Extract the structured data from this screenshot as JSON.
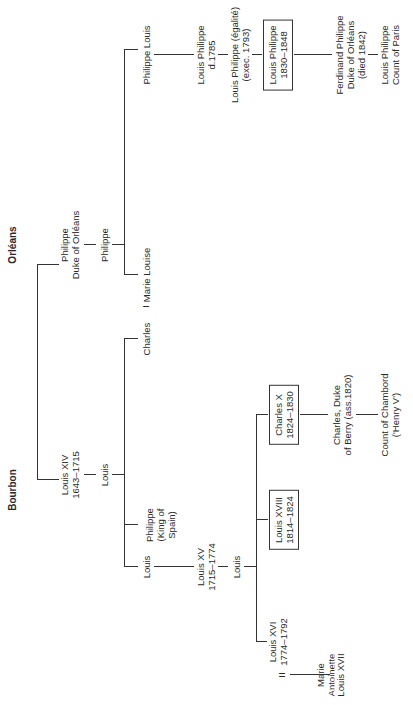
{
  "houses": {
    "bourbon": "Bourbon",
    "orleans": "Orléans"
  },
  "people": {
    "louis_xiv": [
      "Louis XIV",
      "1643–1715"
    ],
    "philippe_duke": [
      "Philippe",
      "Duke of Orléans"
    ],
    "louis_dauphin": [
      "Louis"
    ],
    "philippe_orleans2": [
      "Philippe"
    ],
    "louis_duke_burgundy": [
      "Louis"
    ],
    "philippe_spain": [
      "Philippe",
      "(King of",
      "Spain)"
    ],
    "charles_berry": [
      "Charles"
    ],
    "marie_louise": [
      "Marie Louise"
    ],
    "philippe_louis": [
      "Philippe Louis"
    ],
    "louis_philippe_1785": [
      "Louis Philippe",
      "d.1785"
    ],
    "louis_philippe_egalite": [
      "Louis Philippe (égalité)",
      "(exec. 1793)"
    ],
    "louis_philippe_king": [
      "Louis Philippe",
      "1830–1848"
    ],
    "ferdinand_philippe": [
      "Ferdinand Philippe",
      "Duke of Orléans",
      "(died 1842)"
    ],
    "louis_philippe_paris": [
      "Louis Philippe",
      "Count of Paris"
    ],
    "louis_xv": [
      "Louis XV",
      "1715–1774"
    ],
    "louis_dauphin2": [
      "Louis"
    ],
    "louis_xvi": [
      "Louis XVI",
      "1774–1792"
    ],
    "marie_antoinette": [
      "Marie",
      "Antoinette"
    ],
    "louis_xvii": [
      "Louis XVII"
    ],
    "louis_xviii": [
      "Louis XVIII",
      "1814–1824"
    ],
    "charles_x": [
      "Charles X",
      "1824–1830"
    ],
    "charles_duke_berry": [
      "Charles, Duke",
      "of Berry (ass.1820)"
    ],
    "count_chambord": [
      "Count of Chambord",
      "('Henry V')"
    ]
  },
  "marriage_symbol": "="
}
